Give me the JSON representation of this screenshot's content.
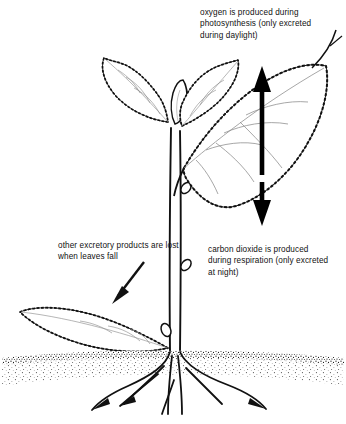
{
  "diagram": {
    "background_color": "#ffffff",
    "ink_color": "#111111",
    "annotations": {
      "oxygen": "oxygen is produced during photosynthesis (only excreted during daylight)",
      "carbon_dioxide": "carbon dioxide is produced during respiration (only excreted at night)",
      "excretory": "other excretory products are lost when leaves fall"
    },
    "arrows": [
      {
        "name": "oxygen-arrow",
        "direction": "up",
        "meaning": "oxygen released upward from leaf"
      },
      {
        "name": "carbon-dioxide-arrow",
        "direction": "down",
        "meaning": "carbon dioxide released downward from leaf"
      },
      {
        "name": "excretory-pointer-arrow",
        "direction": "down-left",
        "meaning": "points to fallen leaf"
      },
      {
        "name": "oxygen-leader-line",
        "direction": "down-left",
        "meaning": "connects oxygen text to upper leaf"
      }
    ],
    "parts": [
      {
        "name": "upper-leaf-left",
        "label": "serrated leaf"
      },
      {
        "name": "upper-leaf-right",
        "label": "serrated leaf"
      },
      {
        "name": "apical-bud",
        "label": "growing tip"
      },
      {
        "name": "large-leaf",
        "label": "large serrated leaf"
      },
      {
        "name": "stem",
        "label": "stem"
      },
      {
        "name": "fallen-leaf",
        "label": "fallen leaf on soil"
      },
      {
        "name": "soil-line",
        "label": "soil surface"
      },
      {
        "name": "roots",
        "label": "root system"
      }
    ]
  }
}
